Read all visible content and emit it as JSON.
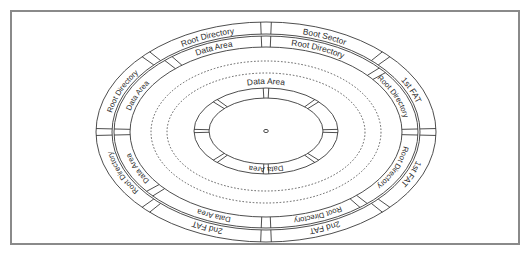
{
  "diagram": {
    "center": [
      266,
      132
    ],
    "line_color": "#3a3a3a",
    "frame_color": "#8a8a8a",
    "outer_band": {
      "labels": [
        {
          "sector": "upper-left-top",
          "text": "Root Directory"
        },
        {
          "sector": "top-right",
          "text": "Boot Sector"
        },
        {
          "sector": "right-upper",
          "text": "1st FAT"
        },
        {
          "sector": "right-lower",
          "text": "1st FAT"
        },
        {
          "sector": "bottom-right",
          "text": "2nd FAT"
        },
        {
          "sector": "bottom-left",
          "text": "2nd FAT"
        },
        {
          "sector": "left-lower",
          "text": "Root Directory"
        },
        {
          "sector": "left-upper",
          "text": "Root Directory"
        }
      ]
    },
    "inner_band": {
      "labels": [
        {
          "sector": "upper-left-top",
          "text": "Data Area"
        },
        {
          "sector": "top-right",
          "text": "Root Directory"
        },
        {
          "sector": "right-upper",
          "text": "Root Directory"
        },
        {
          "sector": "right-lower",
          "text": "Root Directory"
        },
        {
          "sector": "bottom-right",
          "text": "Root Directory"
        },
        {
          "sector": "bottom-left",
          "text": "Data Area"
        },
        {
          "sector": "left-lower",
          "text": "Data Area"
        },
        {
          "sector": "left-upper",
          "text": "Data Area"
        }
      ]
    },
    "inner_disk": {
      "top_label": "Data Area",
      "bottom_label": "Data Area"
    }
  }
}
